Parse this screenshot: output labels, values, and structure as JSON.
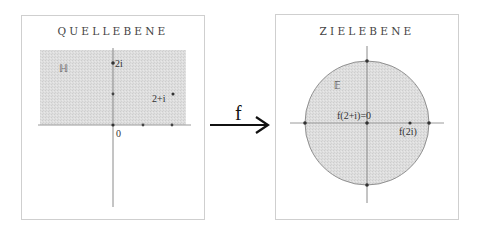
{
  "figure": {
    "map_label": "f",
    "colors": {
      "shade": "#dcdcdc",
      "axis": "#9a9a9a",
      "point": "#333333",
      "frame": "#cfcfcf",
      "arrow": "#111111"
    }
  },
  "source_panel": {
    "title": "QUELLEBENE",
    "region_label": "ℍ",
    "labels": {
      "two_i": "2i",
      "two_plus_i": "2+i",
      "origin": "0"
    }
  },
  "target_panel": {
    "title": "ZIELEBENE",
    "region_label": "𝔼",
    "labels": {
      "f_two_plus_i": "f(2+i)=0",
      "f_two_i": "f(2i)"
    }
  }
}
